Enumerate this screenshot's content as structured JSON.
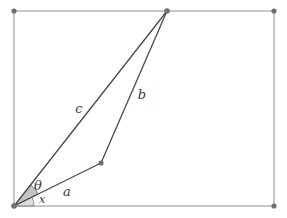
{
  "figure": {
    "type": "geometry-diagram",
    "width": 287,
    "height": 218,
    "background_color": "#ffffff"
  },
  "colors": {
    "frame_stroke": "#a0a0a0",
    "line_stroke": "#4a4a4a",
    "vertex_fill": "#707070",
    "sector_fill": "#b8b8b8",
    "sector_stroke": "#808080",
    "label_color": "#3a3a3a"
  },
  "frame": {
    "name": "bounding-rectangle",
    "x": 14,
    "y": 11,
    "width": 260,
    "height": 195,
    "stroke_width": 1.2,
    "corners": [
      {
        "name": "top-left",
        "x": 14,
        "y": 11
      },
      {
        "name": "top-right",
        "x": 274,
        "y": 11
      },
      {
        "name": "bottom-right",
        "x": 274,
        "y": 206
      },
      {
        "name": "bottom-left",
        "x": 14,
        "y": 206
      }
    ]
  },
  "points": {
    "origin": {
      "label": "O",
      "x": 14,
      "y": 206
    },
    "mid": {
      "label": "M",
      "x": 101,
      "y": 163
    },
    "apex": {
      "label": "A",
      "x": 167,
      "y": 11
    }
  },
  "segments": [
    {
      "name": "segment-a",
      "label": "a",
      "from": "origin",
      "to": "mid",
      "x1": 14,
      "y1": 206,
      "x2": 101,
      "y2": 163,
      "label_x": 67,
      "label_y": 192
    },
    {
      "name": "segment-b",
      "label": "b",
      "from": "mid",
      "to": "apex",
      "x1": 101,
      "y1": 163,
      "x2": 167,
      "y2": 11,
      "label_x": 142,
      "label_y": 95
    },
    {
      "name": "segment-c",
      "label": "c",
      "from": "origin",
      "to": "apex",
      "x1": 14,
      "y1": 206,
      "x2": 167,
      "y2": 11,
      "label_x": 79,
      "label_y": 109
    }
  ],
  "angles": [
    {
      "name": "angle-theta",
      "label": "θ",
      "vertex": "origin",
      "between": [
        "segment-a",
        "segment-c"
      ],
      "radius": 27,
      "start_deg": 26.3,
      "end_deg": 51.9,
      "label_x": 38,
      "label_y": 186,
      "shaded": true
    },
    {
      "name": "angle-x",
      "label": "x",
      "vertex": "origin",
      "between": [
        "baseline",
        "segment-a"
      ],
      "radius": 20,
      "start_deg": 0,
      "end_deg": 26.3,
      "label_x": 42,
      "label_y": 200,
      "shaded": true
    }
  ],
  "vertex_markers": [
    {
      "name": "vertex-origin",
      "x": 14,
      "y": 206,
      "r": 2.8
    },
    {
      "name": "vertex-mid",
      "x": 101,
      "y": 163,
      "r": 2.6
    },
    {
      "name": "vertex-apex",
      "x": 167,
      "y": 11,
      "r": 2.8
    },
    {
      "name": "vertex-frame-top-left",
      "x": 14,
      "y": 11,
      "r": 2.6
    },
    {
      "name": "vertex-frame-top-right",
      "x": 274,
      "y": 11,
      "r": 2.6
    },
    {
      "name": "vertex-frame-bottom-right",
      "x": 274,
      "y": 206,
      "r": 2.6
    }
  ]
}
